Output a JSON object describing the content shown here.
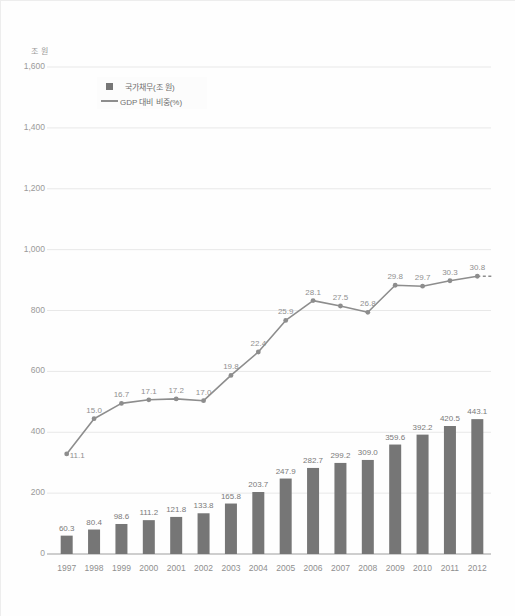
{
  "chart_data": {
    "type": "bar",
    "title": "",
    "subtitle": "",
    "xlabel": "",
    "ylabel": "조 원",
    "ylim": [
      0,
      1600
    ],
    "y2lim": [
      0,
      54.0
    ],
    "grid": true,
    "legend_position": "inside-top-left",
    "categories": [
      "1997",
      "1998",
      "1999",
      "2000",
      "2001",
      "2002",
      "2003",
      "2004",
      "2005",
      "2006",
      "2007",
      "2008",
      "2009",
      "2010",
      "2011",
      "2012"
    ],
    "yticks": [
      "0",
      "200",
      "400",
      "600",
      "800",
      "1,000",
      "1,200",
      "1,400",
      "1,600"
    ],
    "ytick_values": [
      0,
      200,
      400,
      600,
      800,
      1000,
      1200,
      1400,
      1600
    ],
    "series": [
      {
        "name": "국가채무(조 원)",
        "type": "bar",
        "axis": "left",
        "color": "#767676",
        "values": [
          60.3,
          80.4,
          98.6,
          111.2,
          121.8,
          133.8,
          165.8,
          203.7,
          247.9,
          282.7,
          299.2,
          309.0,
          359.6,
          392.2,
          420.5,
          443.1
        ],
        "labels": [
          "60.3",
          "80.4",
          "98.6",
          "111.2",
          "121.8",
          "133.8",
          "165.8",
          "203.7",
          "247.9",
          "282.7",
          "299.2",
          "309.0",
          "359.6",
          "392.2",
          "420.5",
          "443.1"
        ]
      },
      {
        "name": "GDP 대비 비중(%)",
        "type": "line",
        "axis": "right",
        "color": "#8d8d8d",
        "values": [
          11.1,
          15.0,
          16.7,
          17.1,
          17.2,
          17.0,
          19.8,
          22.4,
          25.9,
          28.1,
          27.5,
          26.8,
          29.8,
          29.7,
          30.3,
          30.8
        ],
        "labels": [
          "11.1",
          "15.0",
          "16.7",
          "17.1",
          "17.2",
          "17.0",
          "19.8",
          "22.4",
          "25.9",
          "28.1",
          "27.5",
          "26.8",
          "29.8",
          "29.7",
          "30.3",
          "30.8"
        ],
        "trailing_dashed": true
      }
    ]
  },
  "legend": {
    "items": [
      {
        "label": "국가채무(조 원)",
        "marker": "square"
      },
      {
        "label": "GDP 대비 비중(%)",
        "marker": "line"
      }
    ]
  }
}
